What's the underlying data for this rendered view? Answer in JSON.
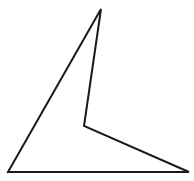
{
  "canvas": {
    "width": 194,
    "height": 181,
    "background_color": "#ffffff",
    "title": "Concave quadrilateral line drawing"
  },
  "figure": {
    "name": "concave-quadrilateral",
    "shape_type": "polygon",
    "vertex_count": 4,
    "closed": true,
    "fill": "none",
    "stroke_color": "#1a1a1a",
    "stroke_width": 2,
    "points": "101,9 84,126 189,172 8,172",
    "vertices": [
      {
        "label": "apex-top",
        "x": 101,
        "y": 9,
        "kind": "convex"
      },
      {
        "label": "reflex-middle",
        "x": 84,
        "y": 126,
        "kind": "reflex"
      },
      {
        "label": "bottom-right",
        "x": 189,
        "y": 172,
        "kind": "convex"
      },
      {
        "label": "bottom-left",
        "x": 8,
        "y": 172,
        "kind": "convex"
      }
    ],
    "edges": [
      {
        "label": "apex-to-reflex",
        "from": "apex-top",
        "to": "reflex-middle"
      },
      {
        "label": "reflex-to-bottom-right",
        "from": "reflex-middle",
        "to": "bottom-right"
      },
      {
        "label": "bottom-edge",
        "from": "bottom-right",
        "to": "bottom-left"
      },
      {
        "label": "bottom-left-to-apex",
        "from": "bottom-left",
        "to": "apex-top"
      }
    ]
  }
}
